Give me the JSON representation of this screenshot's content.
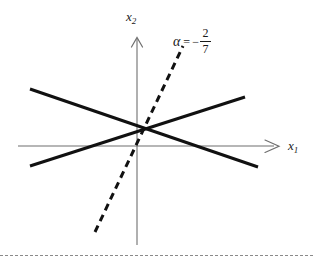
{
  "figure": {
    "title": "",
    "background_color": "#ffffff",
    "width": 313,
    "height": 261
  },
  "axes": {
    "x_axis": {
      "label": "x",
      "subscript": "1",
      "color": "#6b6b6b",
      "arrow": "arrow-right"
    },
    "y_axis": {
      "label": "x",
      "subscript": "2",
      "color": "#6b6b6b",
      "arrow": "arrow-up"
    }
  },
  "annotation": {
    "symbol": "α",
    "equals": "=",
    "sign": "−",
    "numerator": "2",
    "denominator": "7",
    "full_text": "α = − 2/7"
  },
  "chart_data": {
    "type": "line",
    "title": "",
    "xlabel": "x1",
    "ylabel": "x2",
    "grid": false,
    "legend": "none",
    "axis_origin_px": [
      137,
      146
    ],
    "intersection_px": [
      146,
      128
    ],
    "series": [
      {
        "name": "line-descending",
        "style": "solid",
        "color": "#111111",
        "width_px": 3,
        "points_px": [
          [
            30,
            89
          ],
          [
            258,
            167
          ]
        ]
      },
      {
        "name": "line-ascending",
        "style": "solid",
        "color": "#111111",
        "width_px": 3,
        "points_px": [
          [
            30,
            166
          ],
          [
            245,
            97
          ]
        ]
      },
      {
        "name": "line-dashed-alpha",
        "style": "dashed",
        "color": "#111111",
        "width_px": 3,
        "points_px": [
          [
            95,
            232
          ],
          [
            183,
            46
          ]
        ]
      }
    ]
  }
}
